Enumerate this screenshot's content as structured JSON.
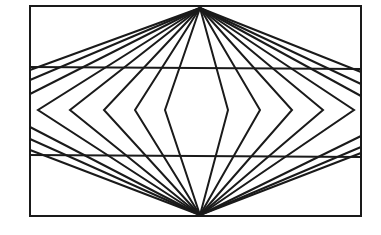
{
  "diagram": {
    "type": "optical-illusion-line-figure",
    "width": 381,
    "height": 235,
    "stroke_color": "#1a1a1a",
    "background_color": "#ffffff",
    "frame": {
      "x1": 30,
      "y1": 6,
      "x2": 361,
      "y2": 216,
      "stroke_width": 2
    },
    "apex_top": {
      "x": 200,
      "y": 8
    },
    "apex_bottom": {
      "x": 200,
      "y": 215
    },
    "horizontal_lines": [
      {
        "x1": 30,
        "y1": 67,
        "x2": 361,
        "y2": 69
      },
      {
        "x1": 30,
        "y1": 155,
        "x2": 361,
        "y2": 157
      }
    ],
    "chevrons_left": [
      {
        "vertex_x": 38,
        "vertex_y": 110
      },
      {
        "vertex_x": 70,
        "vertex_y": 110
      },
      {
        "vertex_x": 104,
        "vertex_y": 110
      },
      {
        "vertex_x": 135,
        "vertex_y": 110
      },
      {
        "vertex_x": 165,
        "vertex_y": 110
      }
    ],
    "chevrons_right": [
      {
        "vertex_x": 228,
        "vertex_y": 110
      },
      {
        "vertex_x": 260,
        "vertex_y": 110
      },
      {
        "vertex_x": 292,
        "vertex_y": 110
      },
      {
        "vertex_x": 323,
        "vertex_y": 110
      },
      {
        "vertex_x": 354,
        "vertex_y": 110
      }
    ],
    "edge_rays_left_top_y": [
      70,
      80,
      94
    ],
    "edge_rays_left_bottom_y": [
      127,
      139,
      150
    ],
    "edge_rays_right_top_y": [
      72,
      84,
      96
    ],
    "edge_rays_right_bottom_y": [
      136,
      147,
      153
    ],
    "line_stroke_width": 2
  }
}
